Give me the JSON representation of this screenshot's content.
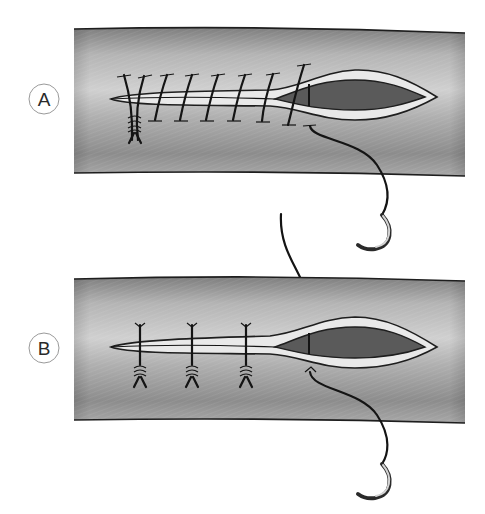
{
  "figure": {
    "type": "medical-illustration",
    "colors": {
      "background": "#ffffff",
      "vessel_light": "#d2d2d2",
      "vessel_mid": "#a4a4a4",
      "vessel_dark": "#7c7c7c",
      "flap": "#e9e9e9",
      "lumen": "#5a5a5a",
      "thread": "#141414",
      "needle": "#c8c8c8"
    },
    "panels": [
      {
        "id": "A",
        "label": "A",
        "technique": "continuous running suture",
        "stitch_count": 7,
        "knots": 1,
        "needles": 1
      },
      {
        "id": "B",
        "label": "B",
        "technique": "interrupted sutures",
        "stitch_count": 3,
        "knots": 3,
        "needles": 2
      }
    ]
  }
}
